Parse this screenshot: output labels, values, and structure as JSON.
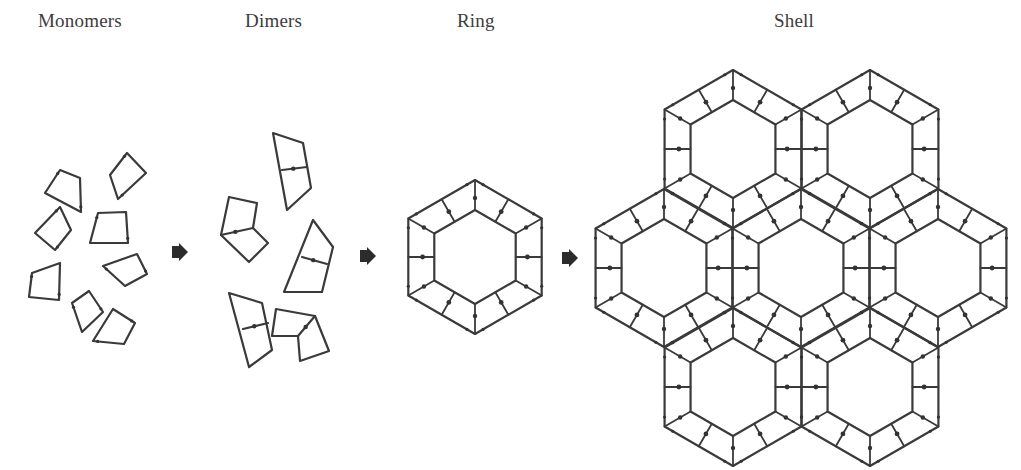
{
  "stages": [
    {
      "id": "monomers",
      "label": "Monomers",
      "label_x": 38,
      "label_y": 22
    },
    {
      "id": "dimers",
      "label": "Dimers",
      "label_x": 245,
      "label_y": 22
    },
    {
      "id": "ring",
      "label": "Ring",
      "label_x": 457,
      "label_y": 22
    },
    {
      "id": "shell",
      "label": "Shell",
      "label_x": 774,
      "label_y": 22
    }
  ],
  "colors": {
    "stroke": "#3a3a3a",
    "text": "#3c3c3c",
    "background": "#ffffff"
  },
  "arrows": [
    {
      "id": "monomers-to-dimers",
      "x": 180,
      "y": 252
    },
    {
      "id": "dimers-to-ring",
      "x": 368,
      "y": 256
    },
    {
      "id": "ring-to-shell",
      "x": 570,
      "y": 258
    }
  ],
  "monomers": [
    [
      [
        127,
        153
      ],
      [
        146,
        173
      ],
      [
        118,
        199
      ],
      [
        110,
        175
      ]
    ],
    [
      [
        60,
        170
      ],
      [
        80,
        178
      ],
      [
        81,
        212
      ],
      [
        45,
        193
      ]
    ],
    [
      [
        60,
        207
      ],
      [
        71,
        230
      ],
      [
        55,
        250
      ],
      [
        35,
        233
      ]
    ],
    [
      [
        98,
        213
      ],
      [
        126,
        212
      ],
      [
        128,
        243
      ],
      [
        90,
        243
      ]
    ],
    [
      [
        103,
        266
      ],
      [
        137,
        254
      ],
      [
        147,
        274
      ],
      [
        125,
        286
      ]
    ],
    [
      [
        32,
        273
      ],
      [
        60,
        263
      ],
      [
        59,
        300
      ],
      [
        29,
        297
      ]
    ],
    [
      [
        72,
        303
      ],
      [
        89,
        291
      ],
      [
        103,
        312
      ],
      [
        82,
        332
      ]
    ],
    [
      [
        93,
        341
      ],
      [
        113,
        309
      ],
      [
        135,
        323
      ],
      [
        124,
        344
      ]
    ]
  ],
  "dimers": [
    {
      "outline": [
        [
          273,
          133
        ],
        [
          303,
          143
        ],
        [
          311,
          188
        ],
        [
          287,
          210
        ]
      ],
      "divider": [
        [
          282,
          170
        ],
        [
          307,
          167
        ]
      ]
    },
    {
      "outline": [
        [
          229,
          197
        ],
        [
          257,
          203
        ],
        [
          253,
          228
        ],
        [
          268,
          243
        ],
        [
          249,
          262
        ],
        [
          221,
          235
        ]
      ],
      "divider": [
        [
          221,
          235
        ],
        [
          253,
          228
        ]
      ]
    },
    {
      "outline": [
        [
          313,
          220
        ],
        [
          333,
          247
        ],
        [
          322,
          292
        ],
        [
          284,
          292
        ]
      ],
      "divider": [
        [
          302,
          257
        ],
        [
          327,
          264
        ]
      ]
    },
    {
      "outline": [
        [
          229,
          293
        ],
        [
          262,
          303
        ],
        [
          272,
          350
        ],
        [
          249,
          367
        ]
      ],
      "divider": [
        [
          243,
          329
        ],
        [
          268,
          323
        ]
      ]
    },
    {
      "outline": [
        [
          276,
          309
        ],
        [
          315,
          316
        ],
        [
          329,
          351
        ],
        [
          300,
          361
        ],
        [
          298,
          336
        ],
        [
          272,
          336
        ]
      ],
      "divider": [
        [
          298,
          336
        ],
        [
          315,
          316
        ]
      ]
    }
  ],
  "ring": {
    "cx": 475,
    "cy": 257,
    "outer_r": 77,
    "inner_r": 47
  },
  "shell": {
    "outer_r": 79,
    "inner_r": 49,
    "hexes": [
      {
        "id": "top-left",
        "cx": 733,
        "cy": 149
      },
      {
        "id": "top-right",
        "cx": 870,
        "cy": 149
      },
      {
        "id": "left",
        "cx": 664,
        "cy": 268
      },
      {
        "id": "center",
        "cx": 801,
        "cy": 268
      },
      {
        "id": "right",
        "cx": 938,
        "cy": 268
      },
      {
        "id": "bottom-left",
        "cx": 733,
        "cy": 387
      },
      {
        "id": "bottom-right",
        "cx": 870,
        "cy": 387
      }
    ]
  }
}
